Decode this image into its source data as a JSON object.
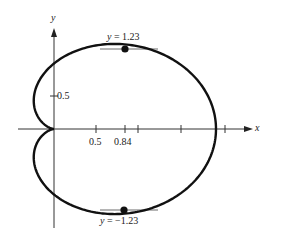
{
  "chart_data": {
    "type": "line",
    "title": "",
    "xlabel": "x",
    "ylabel": "y",
    "x_tick_labels": [
      "0.5",
      "0.84"
    ],
    "y_tick_labels": [
      "0.5"
    ],
    "x_ticks": [
      0.5,
      0.84,
      1.0,
      1.5,
      2.0
    ],
    "y_ticks": [
      0.5
    ],
    "annotations": [
      {
        "text": "y = 1.23",
        "point": [
          0.84,
          1.23
        ]
      },
      {
        "text": "y = −1.23",
        "point": [
          0.84,
          -1.23
        ]
      }
    ],
    "series": [
      {
        "name": "cardioid",
        "equation": "r = 1 + cosθ",
        "x_range": [
          0,
          2
        ],
        "y_range": [
          -1.3,
          1.3
        ]
      }
    ],
    "grid": false
  },
  "labels": {
    "x_axis": "x",
    "y_axis": "y",
    "tick_05x": "0.5",
    "tick_084": "0.84",
    "tick_05y": "0.5",
    "top_annotation_prefix": "y",
    "top_annotation_value": " = 1.23",
    "bottom_annotation_prefix": "y",
    "bottom_annotation_value": " = −1.23"
  }
}
